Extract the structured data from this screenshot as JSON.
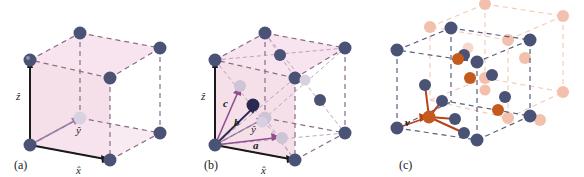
{
  "figure": {
    "background": "#ffffff",
    "panels": [
      {
        "id": "a",
        "label": "(a)",
        "description": "simple cubic unit cell with Cartesian unit vectors",
        "cell_face_color": "#f7e4ee",
        "edge_color": "#8a6c84",
        "atom_color": "#4a5275",
        "axis_color": "#1a1a1a",
        "vectors": [
          {
            "name": "z-hat",
            "label": "ẑ",
            "style": "hat",
            "color": "#1a1a1a"
          },
          {
            "name": "y-hat",
            "label": "ŷ",
            "style": "hat",
            "color": "#9a7fa8"
          },
          {
            "name": "x-hat",
            "label": "x̂",
            "style": "hat",
            "color": "#1a1a1a"
          }
        ],
        "atom_count": 8
      },
      {
        "id": "b",
        "label": "(b)",
        "description": "face-centered cubic cell with primitive lattice vectors",
        "cell_face_color": "#f7e4ee",
        "edge_color": "#8a6c84",
        "atom_color": "#4a5275",
        "face_atom_color": "#cfc3d6",
        "primitive_vector_color": "#8f4f8f",
        "vectors": [
          {
            "name": "z-hat",
            "label": "ẑ",
            "style": "hat",
            "color": "#1a1a1a"
          },
          {
            "name": "y-hat",
            "label": "ŷ",
            "style": "hat",
            "color": "#9a7fa8"
          },
          {
            "name": "x-hat",
            "label": "x̂",
            "style": "hat",
            "color": "#1a1a1a"
          },
          {
            "name": "vector-a",
            "label": "a",
            "style": "bold-italic",
            "color": "#8f4f8f"
          },
          {
            "name": "vector-b",
            "label": "b",
            "style": "bold-italic",
            "color": "#2a2a50"
          },
          {
            "name": "vector-c",
            "label": "c",
            "style": "bold-italic",
            "color": "#8f4f8f"
          }
        ],
        "atom_count": 14
      },
      {
        "id": "c",
        "label": "(c)",
        "description": "diamond / zincblende structure, two-atom basis with tetrahedral bonds",
        "edge_color": "#5a5f7a",
        "atom_color_primary": "#4a5275",
        "atom_color_basis": "#c55a1e",
        "atom_color_faded": "#f2c0ad",
        "bond_color": "#b8431a",
        "vectors": [
          {
            "name": "vector-v",
            "label": "v",
            "style": "bold-italic",
            "color": "#b8431a"
          }
        ]
      }
    ]
  }
}
